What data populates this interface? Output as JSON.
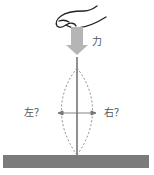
{
  "diagram": {
    "labels": {
      "force": "力",
      "left": "左？",
      "right": "右？"
    },
    "elements": {
      "hand": "hand pressing down on top of rod",
      "force_arrow": "grey downward arrow indicating applied force",
      "rod": "vertical thin rod standing on ground",
      "buckle_outline": "dashed lens-shaped outline showing possible buckling to left or right",
      "direction_arrow": "horizontal double-headed arrow",
      "ground": "grey ground bar"
    },
    "colors": {
      "ground": "#7b7b7b",
      "arrow": "#b5b5b5",
      "rod": "#555555",
      "dashed": "#888888",
      "text": "#555555",
      "hand_stroke": "#222222"
    }
  }
}
